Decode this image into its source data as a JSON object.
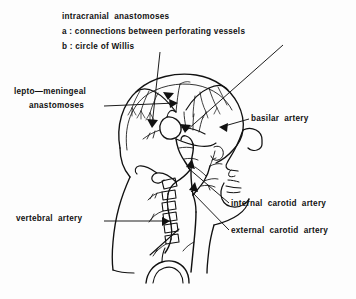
{
  "figure": {
    "kind": "anatomical-line-drawing",
    "background_color": "#fdfdfd",
    "ink_color": "#111111"
  },
  "labels": {
    "intracranial": "intracranial  anastomoses",
    "key_a": "a :  connections  between  perforating  vessels",
    "key_b": "b :  circle   of   Willis",
    "lepto_line1": "lepto—meningeal",
    "lepto_line2": "anastomoses",
    "basilar": "basilar  artery",
    "internal_carotid": "internal  carotid  artery",
    "external_carotid": "external  carotid  artery",
    "vertebral": "vertebral  artery"
  },
  "leader_lines": [
    {
      "name": "circle-of-willis-leader",
      "from": [
        160,
        52
      ],
      "to": [
        152,
        128
      ]
    },
    {
      "name": "perforating-vessels-leader",
      "from": [
        283,
        45
      ],
      "to": [
        185,
        133
      ]
    },
    {
      "name": "lepto-meningeal-leader",
      "from": [
        104,
        106
      ],
      "to": [
        178,
        103
      ]
    },
    {
      "name": "basilar-artery-leader",
      "from": [
        249,
        119
      ],
      "to": [
        219,
        127
      ]
    },
    {
      "name": "internal-carotid-leader",
      "from": [
        229,
        203
      ],
      "to": [
        186,
        167
      ]
    },
    {
      "name": "external-carotid-leader",
      "from": [
        229,
        230
      ],
      "to": [
        189,
        190
      ]
    },
    {
      "name": "vertebral-artery-leader",
      "from": [
        104,
        221
      ],
      "to": [
        170,
        221
      ]
    }
  ]
}
